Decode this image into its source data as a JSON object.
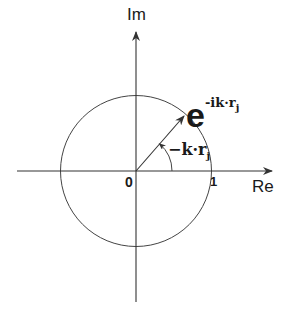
{
  "diagram": {
    "type": "complex-plane-unit-circle",
    "axes": {
      "imaginary_label": "Im",
      "real_label": "Re",
      "origin_label": "0",
      "unit_label": "1"
    },
    "phasor": {
      "base": "e",
      "exponent": "-ik·r",
      "exponent_subscript": "j"
    },
    "angle": {
      "label": "−k·r",
      "label_subscript": "j"
    },
    "colors": {
      "line": "#333333",
      "text": "#1a1a1a",
      "background": "#ffffff"
    }
  }
}
